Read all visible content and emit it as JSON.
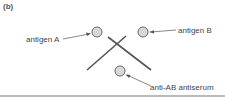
{
  "panel_label": "(b)",
  "labels": {
    "antigen_a": "antigen A",
    "antigen_b": "antigen B",
    "antiserum": "anti-AB antiserum"
  },
  "colors": {
    "well_fill": "#d9d9d9",
    "well_stroke": "#666666",
    "precipitin_line": "#555555",
    "rule": "#777777"
  }
}
